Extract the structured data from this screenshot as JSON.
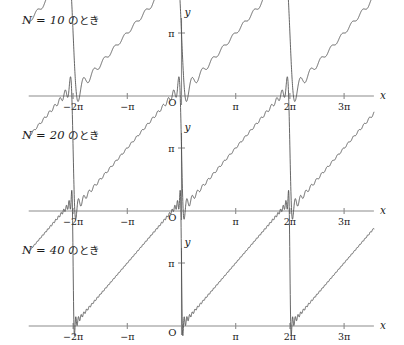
{
  "figure": {
    "title": "",
    "panels": [
      {
        "caption_math": "N = 10",
        "caption_jp": " のとき",
        "N": 10
      },
      {
        "caption_math": "N = 20",
        "caption_jp": " のとき",
        "N": 20
      },
      {
        "caption_math": "N = 40",
        "caption_jp": " のとき",
        "N": 40
      }
    ],
    "axis": {
      "x_label": "x",
      "y_label": "y",
      "origin_label": "O",
      "x_ticks": [
        {
          "value": -2,
          "label": "−2π"
        },
        {
          "value": -1,
          "label": "−π"
        },
        {
          "value": 1,
          "label": "π"
        },
        {
          "value": 2,
          "label": "2π"
        },
        {
          "value": 3,
          "label": "3π"
        }
      ],
      "y_ticks": [
        {
          "value": 3.14159265,
          "label": "π"
        }
      ]
    },
    "colors": {
      "curve": "#4a4a4a",
      "axis": "#8c8c8c",
      "text": "#1a1a1a",
      "background": "#ffffff"
    }
  },
  "chart_data": {
    "type": "line",
    "title": "",
    "xlabel": "x",
    "ylabel": "y",
    "formula": "S_N(x) = π − 2 Σ_{k=1}^{N} sin(kx)/k",
    "xlim": [
      -2.6,
      3.85
    ],
    "ylim": [
      -0.55,
      3.7
    ],
    "xlim_units": "multiples of pi",
    "grid": false,
    "legend": "none",
    "xtick_values": [
      -2,
      -1,
      1,
      2,
      3
    ],
    "xtick_labels": [
      "−2π",
      "−π",
      "π",
      "2π",
      "3π"
    ],
    "ytick_values": [
      3.14159265
    ],
    "ytick_labels": [
      "π"
    ],
    "series": [
      {
        "name": "N = 10",
        "N": 10,
        "panel": 0
      },
      {
        "name": "N = 20",
        "N": 20,
        "panel": 1
      },
      {
        "name": "N = 40",
        "N": 40,
        "panel": 2
      }
    ],
    "sawtooth_breakpoints_in_pi": [
      -3,
      -1,
      1,
      3
    ],
    "peak_value": 3.14159265,
    "trough_value": 0
  }
}
